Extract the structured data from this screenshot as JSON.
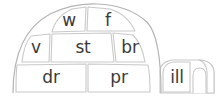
{
  "figure": {
    "name": "igloo-word-blocks",
    "shape": "igloo",
    "colors": {
      "outline": "#c9c9c9",
      "dome_outline": "#b5b5b5",
      "block_fill": "#ffffff",
      "text": "#3a3a3a",
      "background": "#ffffff"
    }
  },
  "dome": {
    "rows": [
      {
        "row_index": 1,
        "blocks": [
          {
            "id": "block-w",
            "label": "w"
          },
          {
            "id": "block-f",
            "label": "f"
          }
        ]
      },
      {
        "row_index": 2,
        "blocks": [
          {
            "id": "block-v",
            "label": "v"
          },
          {
            "id": "block-st",
            "label": "st"
          },
          {
            "id": "block-br",
            "label": "br"
          }
        ]
      },
      {
        "row_index": 3,
        "blocks": [
          {
            "id": "block-dr",
            "label": "dr"
          },
          {
            "id": "block-pr",
            "label": "pr"
          }
        ]
      }
    ]
  },
  "tunnel": {
    "id": "tunnel-entrance",
    "blocks": [
      {
        "id": "block-ill",
        "label": "ill"
      }
    ],
    "doorway": "arch-icon"
  }
}
